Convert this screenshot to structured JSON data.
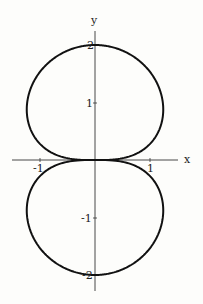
{
  "chart_data": {
    "type": "line",
    "title": "",
    "xlabel": "x",
    "ylabel": "y",
    "equation_hint": "polar curve r = 2*sqrt(|sin(theta)|)",
    "x_ticks": [
      -1,
      1
    ],
    "y_ticks": [
      2,
      1,
      -1,
      -2
    ],
    "x_tick_labels": [
      "-1",
      "1"
    ],
    "y_tick_labels": [
      "2",
      "1",
      "-1",
      "-2"
    ],
    "xlim": [
      -1.5,
      1.7
    ],
    "ylim": [
      -2.3,
      2.2
    ],
    "grid": false,
    "legend": null,
    "series": [
      {
        "name": "curve",
        "sample_points": [
          {
            "x": 0,
            "y": 2
          },
          {
            "x": 1.24,
            "y": 0.88
          },
          {
            "x": 0,
            "y": 0
          },
          {
            "x": -1.24,
            "y": 0.88
          },
          {
            "x": 1.24,
            "y": -0.88
          },
          {
            "x": 0,
            "y": -2
          },
          {
            "x": -1.24,
            "y": -0.88
          }
        ]
      }
    ]
  },
  "labels": {
    "x_axis": "x",
    "y_axis": "y",
    "xtick_neg1": "-1",
    "xtick_1": "1",
    "ytick_2": "2",
    "ytick_1": "1",
    "ytick_neg1": "-1",
    "ytick_neg2": "-2"
  }
}
